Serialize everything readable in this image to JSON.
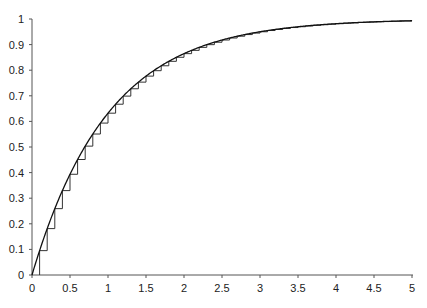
{
  "chart_data": {
    "type": "line",
    "title": "",
    "xlabel": "",
    "ylabel": "",
    "xlim": [
      0,
      5
    ],
    "ylim": [
      0,
      1
    ],
    "grid": false,
    "legend": null,
    "x_ticks": [
      "0",
      "0.5",
      "1",
      "1.5",
      "2",
      "2.5",
      "3",
      "3.5",
      "4",
      "4.5",
      "5"
    ],
    "y_ticks": [
      "0",
      "0.1",
      "0.2",
      "0.3",
      "0.4",
      "0.5",
      "0.6",
      "0.7",
      "0.8",
      "0.9",
      "1"
    ],
    "series": [
      {
        "name": "smooth curve",
        "style": "line",
        "description": "y = 1 - exp(-x)",
        "x": [
          0,
          0.25,
          0.5,
          0.75,
          1,
          1.5,
          2,
          2.5,
          3,
          3.5,
          4,
          4.5,
          5
        ],
        "values": [
          0,
          0.221,
          0.393,
          0.528,
          0.632,
          0.777,
          0.865,
          0.918,
          0.95,
          0.97,
          0.982,
          0.989,
          0.993
        ]
      },
      {
        "name": "step approximation",
        "style": "step",
        "description": "staircase with step width 0.1, jumping to 1 - exp(-x) at each x = 0.1k",
        "step_width": 0.1,
        "x": [
          0.1,
          0.2,
          0.3,
          0.4,
          0.5,
          0.6,
          0.7,
          0.8,
          0.9,
          1.0,
          1.5,
          2.0,
          2.5,
          3.0,
          4.0,
          5.0
        ],
        "values": [
          0.095,
          0.181,
          0.259,
          0.33,
          0.393,
          0.451,
          0.503,
          0.551,
          0.593,
          0.632,
          0.777,
          0.865,
          0.918,
          0.95,
          0.982,
          0.993
        ]
      }
    ]
  }
}
